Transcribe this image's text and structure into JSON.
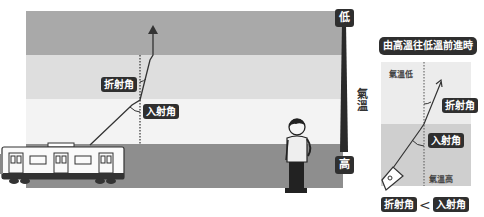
{
  "scene": {
    "bands": [
      {
        "name": "top",
        "color": "#a9a9a9",
        "top": 11,
        "height": 44
      },
      {
        "name": "upper-middle",
        "color": "#dedede",
        "top": 55,
        "height": 44
      },
      {
        "name": "lower-middle",
        "color": "#f3f3f3",
        "top": 99,
        "height": 45
      },
      {
        "name": "ground",
        "color": "#8e8e8e",
        "top": 144,
        "height": 44
      }
    ],
    "labels": {
      "refraction_angle": "折射角",
      "incidence_angle": "入射角"
    }
  },
  "temperature_scale": {
    "low_label": "低",
    "high_label": "高",
    "axis_label": "氣溫"
  },
  "inset": {
    "title": "由高溫往低溫前進時",
    "low_temp_label": "氣溫低",
    "high_temp_label": "氣溫高",
    "refraction_angle": "折射角",
    "incidence_angle": "入射角",
    "comparison": {
      "left": "折射角",
      "operator": "<",
      "right": "入射角"
    },
    "colors": {
      "low_region": "#ececec",
      "high_region": "#cfcfcf"
    }
  },
  "colors": {
    "tag_bg": "#2f2f2f",
    "tag_text": "#ffffff",
    "ray": "#333333"
  }
}
